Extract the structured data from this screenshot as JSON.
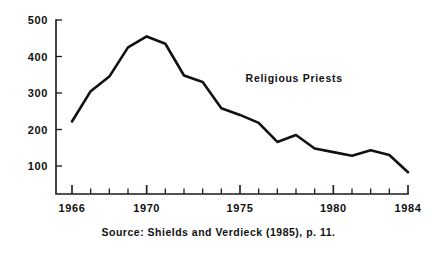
{
  "chart_data": {
    "type": "line",
    "title": "",
    "subtitle": "",
    "xlabel": "",
    "ylabel": "",
    "xlim": [
      1966,
      1984
    ],
    "ylim": [
      0,
      500
    ],
    "grid": false,
    "legend_position": "inline-annotation",
    "annotations": [
      {
        "text": "Religious Priests",
        "x": 1975.3,
        "y": 330
      }
    ],
    "series": [
      {
        "name": "Religious Priests",
        "x": [
          1966,
          1967,
          1968,
          1969,
          1970,
          1971,
          1972,
          1973,
          1974,
          1975,
          1976,
          1977,
          1978,
          1979,
          1980,
          1981,
          1982,
          1983,
          1984
        ],
        "values": [
          222,
          305,
          345,
          425,
          455,
          435,
          348,
          330,
          258,
          240,
          218,
          166,
          185,
          148,
          138,
          128,
          143,
          130,
          83
        ]
      }
    ],
    "yticks": [
      100,
      200,
      300,
      400,
      500
    ],
    "ytick_labels": [
      "100",
      "200",
      "300",
      "400",
      "500"
    ],
    "xticks": [
      1966,
      1967,
      1968,
      1969,
      1970,
      1971,
      1972,
      1973,
      1974,
      1975,
      1976,
      1977,
      1978,
      1979,
      1980,
      1981,
      1982,
      1983,
      1984
    ],
    "xtick_labels_shown": [
      {
        "value": 1966,
        "label": "1966"
      },
      {
        "value": 1970,
        "label": "1970"
      },
      {
        "value": 1975,
        "label": "1975"
      },
      {
        "value": 1980,
        "label": "1980"
      },
      {
        "value": 1984,
        "label": "1984"
      }
    ],
    "line_color": "#111111",
    "axis_color": "#1a1a1a",
    "background_color": "#ffffff"
  },
  "source_note": "Source: Shields and Verdieck (1985), p. 11."
}
